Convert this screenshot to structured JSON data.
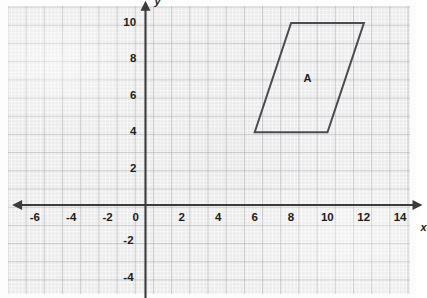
{
  "chart_data": {
    "type": "scatter",
    "title": "",
    "xlabel": "x",
    "ylabel": "y",
    "xlim": [
      -7,
      15
    ],
    "ylim": [
      -5,
      11
    ],
    "grid": true,
    "legend": null,
    "x_ticks": [
      {
        "value": -6,
        "label": "-6"
      },
      {
        "value": -4,
        "label": "-4"
      },
      {
        "value": -2,
        "label": "-2"
      },
      {
        "value": 0,
        "label": "0"
      },
      {
        "value": 2,
        "label": "2"
      },
      {
        "value": 4,
        "label": "4"
      },
      {
        "value": 6,
        "label": "6"
      },
      {
        "value": 8,
        "label": "8"
      },
      {
        "value": 10,
        "label": "10"
      },
      {
        "value": 12,
        "label": "12"
      },
      {
        "value": 14,
        "label": "14"
      }
    ],
    "y_ticks": [
      {
        "value": 10,
        "label": "10"
      },
      {
        "value": 8,
        "label": "8"
      },
      {
        "value": 6,
        "label": "6"
      },
      {
        "value": 4,
        "label": "4"
      },
      {
        "value": 2,
        "label": "2"
      },
      {
        "value": -2,
        "label": "-2"
      },
      {
        "value": -4,
        "label": "-4"
      }
    ],
    "shapes": [
      {
        "name": "A",
        "type": "parallelogram",
        "label": "A",
        "label_at": [
          8.9,
          7.0
        ],
        "vertices": [
          [
            6,
            4
          ],
          [
            8,
            10
          ],
          [
            12,
            10
          ],
          [
            10,
            4
          ]
        ],
        "stroke": "#4a4a50",
        "fill": "none"
      }
    ]
  },
  "axes": {
    "x_axis_name": "x",
    "y_axis_name": "y",
    "origin_label": "0"
  },
  "colors": {
    "paper": "#ecebeb",
    "grid_minor": "#ffffff",
    "grid_major": "#a6aab2",
    "axis": "#3b3b3b",
    "shape_stroke": "#4a4a50",
    "text": "#1d1d1d"
  }
}
